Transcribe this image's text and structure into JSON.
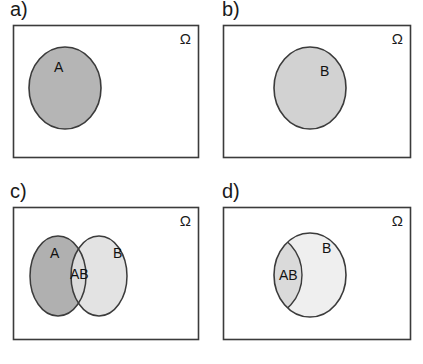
{
  "figure": {
    "type": "venn-diagram-set",
    "background_color": "#ffffff",
    "frame_stroke": "#3b3b3b",
    "circle_stroke": "#3b3b3b"
  },
  "panels": [
    {
      "id": "a",
      "label": "a)",
      "universe_symbol": "Ω",
      "frame": {
        "x": 13,
        "y": 25,
        "width": 186,
        "height": 133
      },
      "shapes": [
        {
          "name": "set-a-circle",
          "label": "A",
          "cx": 65,
          "cy": 88,
          "rx": 36,
          "ry": 41,
          "fill": "#b5b5b5",
          "label_x": 54,
          "label_y": 72
        }
      ]
    },
    {
      "id": "b",
      "label": "b)",
      "universe_symbol": "Ω",
      "frame": {
        "x": 11,
        "y": 25,
        "width": 188,
        "height": 133
      },
      "shapes": [
        {
          "name": "set-b-circle",
          "label": "B",
          "cx": 98,
          "cy": 88,
          "rx": 36,
          "ry": 41,
          "fill": "#d2d2d2",
          "label_x": 108,
          "label_y": 76
        }
      ]
    },
    {
      "id": "c",
      "label": "c)",
      "universe_symbol": "Ω",
      "frame": {
        "x": 13,
        "y": 25,
        "width": 186,
        "height": 133
      },
      "shapes": [
        {
          "name": "set-a-circle",
          "label": "A",
          "cx": 58,
          "cy": 94,
          "rx": 28,
          "ry": 40,
          "fill": "#b0b0b0",
          "label_x": 50,
          "label_y": 76
        },
        {
          "name": "set-b-circle",
          "label": "B",
          "cx": 99,
          "cy": 94,
          "rx": 28,
          "ry": 40,
          "fill": "#e3e3e3",
          "label_x": 113,
          "label_y": 76
        },
        {
          "name": "intersection-region",
          "label": "AB",
          "fill": "#dcdcdc",
          "label_x": 70,
          "label_y": 97
        }
      ]
    },
    {
      "id": "d",
      "label": "d)",
      "universe_symbol": "Ω",
      "frame": {
        "x": 11,
        "y": 25,
        "width": 188,
        "height": 133
      },
      "shapes": [
        {
          "name": "set-b-circle",
          "label": "B",
          "cx": 98,
          "cy": 93,
          "rx": 36,
          "ry": 42,
          "fill": "#efefef",
          "label_x": 110,
          "label_y": 71
        },
        {
          "name": "intersection-region",
          "label": "AB",
          "fill": "#dadada",
          "label_x": 67,
          "label_y": 98
        }
      ]
    }
  ]
}
